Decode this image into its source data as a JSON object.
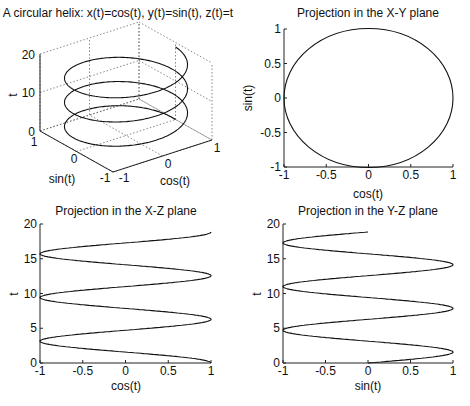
{
  "chart_data": [
    {
      "type": "line",
      "name": "helix-3d",
      "title": "A circular helix: x(t)=cos(t), y(t)=sin(t), z(t)=t",
      "xlabel": "cos(t)",
      "ylabel": "sin(t)",
      "zlabel": "t",
      "xticks": [
        "-1",
        "0",
        "1"
      ],
      "yticks": [
        "-1",
        "0",
        "1"
      ],
      "zticks": [
        "0",
        "10",
        "20"
      ],
      "xlim": [
        -1,
        1
      ],
      "ylim": [
        -1,
        1
      ],
      "zlim": [
        0,
        20
      ],
      "grid": true,
      "t_range": [
        0,
        18.85
      ]
    },
    {
      "type": "line",
      "name": "projection-xy",
      "title": "Projection in the X-Y plane",
      "xlabel": "cos(t)",
      "ylabel": "sin(t)",
      "xticks": [
        "-1",
        "-0.5",
        "0",
        "0.5",
        "1"
      ],
      "yticks": [
        "-1",
        "-0.5",
        "0",
        "0.5",
        "1"
      ],
      "xlim": [
        -1,
        1
      ],
      "ylim": [
        -1,
        1
      ],
      "grid": false
    },
    {
      "type": "line",
      "name": "projection-xz",
      "title": "Projection in the X-Z plane",
      "xlabel": "cos(t)",
      "ylabel": "t",
      "xticks": [
        "-1",
        "-0.5",
        "0",
        "0.5",
        "1"
      ],
      "yticks": [
        "0",
        "5",
        "10",
        "15",
        "20"
      ],
      "xlim": [
        -1,
        1
      ],
      "ylim": [
        0,
        20
      ],
      "grid": false
    },
    {
      "type": "line",
      "name": "projection-yz",
      "title": "Projection in the Y-Z plane",
      "xlabel": "sin(t)",
      "ylabel": "t",
      "xticks": [
        "-1",
        "-0.5",
        "0",
        "0.5",
        "1"
      ],
      "yticks": [
        "0",
        "5",
        "10",
        "15",
        "20"
      ],
      "xlim": [
        -1,
        1
      ],
      "ylim": [
        0,
        20
      ],
      "grid": false
    }
  ],
  "titles": {
    "helix": "A circular helix: x(t)=cos(t), y(t)=sin(t), z(t)=t",
    "xy": "Projection in the X-Y plane",
    "xz": "Projection in the X-Z plane",
    "yz": "Projection in the Y-Z plane"
  },
  "labels": {
    "cos": "cos(t)",
    "sin": "sin(t)",
    "t": "t"
  },
  "caption": "(clipped caption text, illegible)"
}
